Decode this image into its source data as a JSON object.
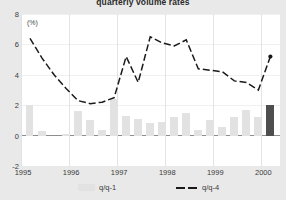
{
  "chart": {
    "title": "quarterly volume rates",
    "unit_label": "(%)"
  },
  "legend": [
    {
      "label": "q/q-1",
      "marker": "bar-swatch",
      "color": "#e2e2e2"
    },
    {
      "label": "q/q-4",
      "marker": "dashed-line",
      "color": "#1a1a1a"
    }
  ],
  "chart_data": {
    "type": "bar",
    "title": "quarterly volume rates",
    "xlabel": "",
    "ylabel": "(%)",
    "ylim": [
      -2,
      8
    ],
    "yticks": [
      8,
      6,
      4,
      2,
      0,
      -2
    ],
    "xticks": [
      "1995",
      "1996",
      "1997",
      "1998",
      "1999",
      "2000"
    ],
    "grid": true,
    "legend_position": "bottom",
    "x": [
      "1995Q1",
      "1995Q2",
      "1995Q3",
      "1995Q4",
      "1996Q1",
      "1996Q2",
      "1996Q3",
      "1996Q4",
      "1997Q1",
      "1997Q2",
      "1997Q3",
      "1997Q4",
      "1998Q1",
      "1998Q2",
      "1998Q3",
      "1998Q4",
      "1999Q1",
      "1999Q2",
      "1999Q3",
      "1999Q4",
      "2000Q1"
    ],
    "series": [
      {
        "name": "q/q-1",
        "type": "bar",
        "color": "#e2e2e2",
        "highlight_color": "#4e4e4e",
        "highlight_index": 20,
        "values": [
          2.0,
          0.3,
          0.0,
          0.1,
          1.6,
          1.0,
          0.4,
          2.4,
          1.3,
          1.1,
          0.8,
          0.9,
          1.2,
          1.5,
          0.4,
          1.0,
          0.6,
          1.2,
          1.7,
          1.2,
          2.0
        ]
      },
      {
        "name": "q/q-4",
        "type": "line",
        "color": "#1a1a1a",
        "dashed": true,
        "end_marker": true,
        "values": [
          6.4,
          5.1,
          4.0,
          3.1,
          2.3,
          2.1,
          2.2,
          2.5,
          5.2,
          3.5,
          6.5,
          6.1,
          5.9,
          6.3,
          4.4,
          4.3,
          4.2,
          3.6,
          3.5,
          3.0,
          5.2
        ]
      }
    ]
  }
}
